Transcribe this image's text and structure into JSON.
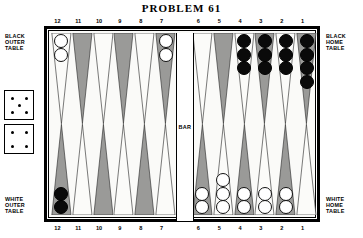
{
  "title": "PROBLEM  61",
  "labels": {
    "black_outer": "BLACK\nOUTER\nTABLE",
    "white_outer": "WHITE\nOUTER\nTABLE",
    "black_home": "BLACK\nHOME\nTABLE",
    "white_home": "WHITE\nHOME\nTABLE",
    "bar": "BAR"
  },
  "dice": [
    {
      "name": "die-top",
      "value": 5
    },
    {
      "name": "die-bottom",
      "value": 4
    }
  ],
  "numbers": {
    "top_left": [
      "12",
      "11",
      "10",
      "9",
      "8",
      "7"
    ],
    "top_right": [
      "6",
      "5",
      "4",
      "3",
      "2",
      "1"
    ],
    "bottom_left": [
      "12",
      "11",
      "10",
      "9",
      "8",
      "7"
    ],
    "bottom_right": [
      "6",
      "5",
      "4",
      "3",
      "2",
      "1"
    ]
  },
  "board": {
    "top_left": [
      {
        "point": "12",
        "shade": "light",
        "checkers": 2,
        "color": "white"
      },
      {
        "point": "11",
        "shade": "dark",
        "checkers": 0,
        "color": "none"
      },
      {
        "point": "10",
        "shade": "light",
        "checkers": 0,
        "color": "none"
      },
      {
        "point": "9",
        "shade": "dark",
        "checkers": 0,
        "color": "none"
      },
      {
        "point": "8",
        "shade": "light",
        "checkers": 0,
        "color": "none"
      },
      {
        "point": "7",
        "shade": "dark",
        "checkers": 2,
        "color": "white"
      }
    ],
    "top_right": [
      {
        "point": "6",
        "shade": "light",
        "checkers": 0,
        "color": "none"
      },
      {
        "point": "5",
        "shade": "dark",
        "checkers": 0,
        "color": "none"
      },
      {
        "point": "4",
        "shade": "light",
        "checkers": 3,
        "color": "black"
      },
      {
        "point": "3",
        "shade": "dark",
        "checkers": 3,
        "color": "black"
      },
      {
        "point": "2",
        "shade": "light",
        "checkers": 3,
        "color": "black"
      },
      {
        "point": "1",
        "shade": "dark",
        "checkers": 4,
        "color": "black"
      }
    ],
    "bottom_left": [
      {
        "point": "12",
        "shade": "dark",
        "checkers": 2,
        "color": "black"
      },
      {
        "point": "11",
        "shade": "light",
        "checkers": 0,
        "color": "none"
      },
      {
        "point": "10",
        "shade": "dark",
        "checkers": 0,
        "color": "none"
      },
      {
        "point": "9",
        "shade": "light",
        "checkers": 0,
        "color": "none"
      },
      {
        "point": "8",
        "shade": "dark",
        "checkers": 0,
        "color": "none"
      },
      {
        "point": "7",
        "shade": "light",
        "checkers": 0,
        "color": "none"
      }
    ],
    "bottom_right": [
      {
        "point": "6",
        "shade": "dark",
        "checkers": 2,
        "color": "white"
      },
      {
        "point": "5",
        "shade": "light",
        "checkers": 3,
        "color": "white"
      },
      {
        "point": "4",
        "shade": "dark",
        "checkers": 2,
        "color": "white"
      },
      {
        "point": "3",
        "shade": "light",
        "checkers": 2,
        "color": "white"
      },
      {
        "point": "2",
        "shade": "dark",
        "checkers": 2,
        "color": "white"
      },
      {
        "point": "1",
        "shade": "light",
        "checkers": 0,
        "color": "none"
      }
    ]
  },
  "colors": {
    "point_dark": "#9a9a98",
    "point_light": "#fbfbf9",
    "checker_black": "#0a0a0a",
    "checker_white": "#ffffff",
    "board_bg": "#fafaf8",
    "frame": "#000000"
  }
}
